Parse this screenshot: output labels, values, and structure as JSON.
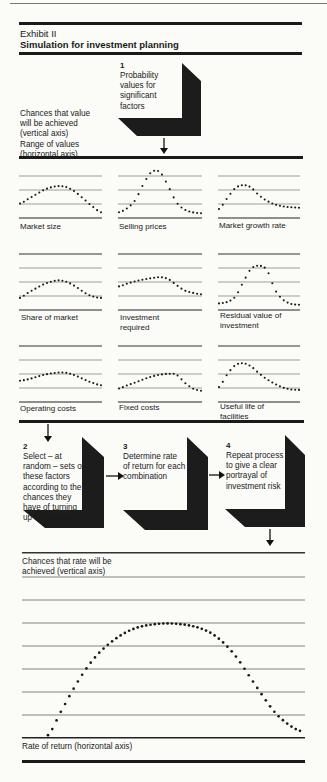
{
  "header": {
    "exhibit": "Exhibit II",
    "title": "Simulation for investment planning"
  },
  "legend": {
    "vertical": [
      "Chances that value",
      "will be achieved",
      "(vertical axis)"
    ],
    "horizontal": [
      "Range of values",
      "(horizontal axis)"
    ]
  },
  "steps": [
    {
      "number": "1",
      "lines": [
        "Probability",
        "values for",
        "significant",
        "factors"
      ]
    },
    {
      "number": "2",
      "lines": [
        "Select – at",
        "random – sets of",
        "these factors",
        "according to the",
        "chances they",
        "have of turning",
        "up in the future"
      ]
    },
    {
      "number": "3",
      "lines": [
        "Determine rate",
        "of return for each",
        "combination"
      ]
    },
    {
      "number": "4",
      "lines": [
        "Repeat process",
        "to give a clear",
        "portrayal of",
        "investment risk"
      ]
    }
  ],
  "factors": [
    {
      "label": [
        "Market size"
      ]
    },
    {
      "label": [
        "Selling prices"
      ]
    },
    {
      "label": [
        "Market growth rate"
      ]
    },
    {
      "label": [
        "Share of market"
      ]
    },
    {
      "label": [
        "Investment",
        "required"
      ]
    },
    {
      "label": [
        "Residual value of",
        "investment"
      ]
    },
    {
      "label": [
        "Operating costs"
      ]
    },
    {
      "label": [
        "Fixed costs"
      ]
    },
    {
      "label": [
        "Useful life of",
        "facilities"
      ]
    }
  ],
  "result_chart": {
    "ylabel": [
      "Chances that rate will be",
      "achieved (vertical axis)"
    ],
    "xlabel": "Rate of return (horizontal axis)"
  },
  "chart_data": [
    {
      "type": "line",
      "title": "Market size",
      "x": [
        0,
        0.1,
        0.2,
        0.3,
        0.4,
        0.5,
        0.6,
        0.7,
        0.8,
        0.9,
        1.0
      ],
      "values": [
        0.27,
        0.37,
        0.47,
        0.57,
        0.63,
        0.65,
        0.61,
        0.5,
        0.35,
        0.2,
        0.08
      ],
      "ylim": [
        0,
        1
      ]
    },
    {
      "type": "line",
      "title": "Selling prices",
      "x": [
        0,
        0.1,
        0.2,
        0.3,
        0.4,
        0.5,
        0.6,
        0.7,
        0.8,
        0.9,
        1.0
      ],
      "values": [
        0.08,
        0.17,
        0.35,
        0.7,
        0.96,
        0.95,
        0.65,
        0.3,
        0.14,
        0.08,
        0.06
      ],
      "ylim": [
        0,
        1
      ]
    },
    {
      "type": "line",
      "title": "Market growth rate",
      "x": [
        0,
        0.1,
        0.2,
        0.3,
        0.4,
        0.5,
        0.6,
        0.7,
        0.8,
        0.9,
        1.0
      ],
      "values": [
        0.15,
        0.38,
        0.6,
        0.67,
        0.62,
        0.45,
        0.33,
        0.25,
        0.21,
        0.19,
        0.18
      ],
      "ylim": [
        0,
        1
      ]
    },
    {
      "type": "line",
      "title": "Share of market",
      "x": [
        0,
        0.1,
        0.2,
        0.3,
        0.4,
        0.5,
        0.6,
        0.7,
        0.8,
        0.9,
        1.0
      ],
      "values": [
        0.22,
        0.33,
        0.43,
        0.52,
        0.58,
        0.6,
        0.55,
        0.45,
        0.33,
        0.25,
        0.22
      ],
      "ylim": [
        0,
        1
      ]
    },
    {
      "type": "line",
      "title": "Investment required",
      "x": [
        0,
        0.1,
        0.2,
        0.3,
        0.4,
        0.5,
        0.6,
        0.7,
        0.8,
        0.9,
        1.0
      ],
      "values": [
        0.47,
        0.53,
        0.58,
        0.62,
        0.65,
        0.67,
        0.63,
        0.5,
        0.38,
        0.33,
        0.3
      ],
      "ylim": [
        0,
        1
      ]
    },
    {
      "type": "line",
      "title": "Residual value of investment",
      "x": [
        0,
        0.1,
        0.2,
        0.3,
        0.4,
        0.5,
        0.6,
        0.7,
        0.8,
        0.9,
        1.0
      ],
      "values": [
        0.1,
        0.13,
        0.24,
        0.55,
        0.85,
        0.92,
        0.82,
        0.4,
        0.18,
        0.09,
        0.07
      ],
      "ylim": [
        0,
        1
      ]
    },
    {
      "type": "line",
      "title": "Operating costs",
      "x": [
        0,
        0.1,
        0.2,
        0.3,
        0.4,
        0.5,
        0.6,
        0.7,
        0.8,
        0.9,
        1.0
      ],
      "values": [
        0.42,
        0.45,
        0.5,
        0.55,
        0.58,
        0.6,
        0.58,
        0.52,
        0.44,
        0.37,
        0.32
      ],
      "ylim": [
        0,
        1
      ]
    },
    {
      "type": "line",
      "title": "Fixed costs",
      "x": [
        0,
        0.1,
        0.2,
        0.3,
        0.4,
        0.5,
        0.6,
        0.7,
        0.8,
        0.9,
        1.0
      ],
      "values": [
        0.25,
        0.32,
        0.38,
        0.45,
        0.51,
        0.55,
        0.57,
        0.55,
        0.38,
        0.25,
        0.2
      ],
      "ylim": [
        0,
        1
      ]
    },
    {
      "type": "line",
      "title": "Useful life of facilities",
      "x": [
        0,
        0.1,
        0.2,
        0.3,
        0.4,
        0.5,
        0.6,
        0.7,
        0.8,
        0.9,
        1.0
      ],
      "values": [
        0.28,
        0.55,
        0.75,
        0.8,
        0.73,
        0.58,
        0.45,
        0.35,
        0.27,
        0.23,
        0.22
      ],
      "ylim": [
        0,
        1
      ]
    },
    {
      "type": "line",
      "title": "Rate of return distribution",
      "xlabel": "Rate of return (horizontal axis)",
      "ylabel": "Chances that rate will be achieved (vertical axis)",
      "x": [
        0,
        0.05,
        0.1,
        0.15,
        0.2,
        0.25,
        0.3,
        0.35,
        0.4,
        0.45,
        0.5,
        0.55,
        0.6,
        0.65,
        0.7,
        0.75,
        0.8,
        0.85,
        0.9,
        0.95,
        1.0
      ],
      "values": [
        0.02,
        0.18,
        0.34,
        0.48,
        0.59,
        0.67,
        0.73,
        0.77,
        0.79,
        0.8,
        0.8,
        0.79,
        0.77,
        0.73,
        0.66,
        0.56,
        0.43,
        0.3,
        0.18,
        0.1,
        0.05
      ],
      "ylim": [
        0,
        1
      ]
    }
  ]
}
